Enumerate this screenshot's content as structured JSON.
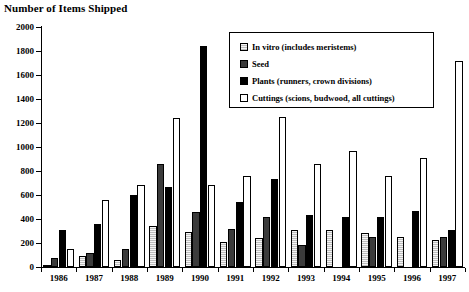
{
  "title": "Number of Items  Shipped",
  "legend": {
    "items": [
      {
        "key": "invitro",
        "label": "In vitro (includes meristems)",
        "color": "#bdbdbd"
      },
      {
        "key": "seed",
        "label": "Seed",
        "color": "#3b3b3b"
      },
      {
        "key": "plants",
        "label": "Plants (runners, crown divisions)",
        "color": "#000000"
      },
      {
        "key": "cuttings",
        "label": "Cuttings (scions, budwood, all cuttings)",
        "color": "#ffffff"
      }
    ]
  },
  "axis": {
    "y_ticks": [
      "2000",
      "1800",
      "1600",
      "1400",
      "1200",
      "1000",
      "800",
      "600",
      "400",
      "200",
      "0"
    ],
    "x_ticks": [
      "1986",
      "1987",
      "1988",
      "1989",
      "1990",
      "1991",
      "1992",
      "1993",
      "1994",
      "1995",
      "1996",
      "1997"
    ]
  },
  "chart_data": {
    "type": "bar",
    "title": "Number of Items  Shipped",
    "xlabel": "",
    "ylabel": "",
    "ylim": [
      0,
      2000
    ],
    "ytick_step": 200,
    "grid": false,
    "legend_position": "upper-right-inset",
    "categories": [
      "1986",
      "1987",
      "1988",
      "1989",
      "1990",
      "1991",
      "1992",
      "1993",
      "1994",
      "1995",
      "1996",
      "1997"
    ],
    "series": [
      {
        "name": "In vitro (includes meristems)",
        "color": "#bdbdbd",
        "values": [
          20,
          90,
          55,
          345,
          290,
          205,
          240,
          310,
          310,
          280,
          250,
          225
        ]
      },
      {
        "name": "Seed",
        "color": "#3b3b3b",
        "values": [
          75,
          120,
          150,
          860,
          455,
          320,
          420,
          180,
          0,
          250,
          0,
          250
        ]
      },
      {
        "name": "Plants (runners, crown divisions)",
        "color": "#000000",
        "values": [
          310,
          360,
          600,
          670,
          1840,
          545,
          730,
          430,
          420,
          420,
          470,
          310
        ]
      },
      {
        "name": "Cuttings (scions, budwood, all cuttings)",
        "color": "#ffffff",
        "values": [
          150,
          560,
          680,
          1240,
          685,
          760,
          1250,
          860,
          970,
          760,
          910,
          1720
        ]
      }
    ]
  }
}
